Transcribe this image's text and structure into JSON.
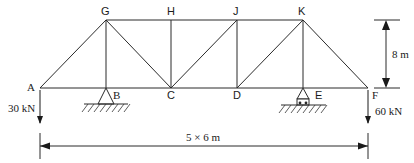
{
  "diagram": {
    "type": "truss",
    "joints": {
      "A": "A",
      "B": "B",
      "C": "C",
      "D": "D",
      "E": "E",
      "F": "F",
      "G": "G",
      "H": "H",
      "J": "J",
      "K": "K"
    },
    "members": [
      [
        "A",
        "G"
      ],
      [
        "A",
        "B"
      ],
      [
        "G",
        "B"
      ],
      [
        "G",
        "H"
      ],
      [
        "G",
        "C"
      ],
      [
        "B",
        "C"
      ],
      [
        "H",
        "C"
      ],
      [
        "H",
        "J"
      ],
      [
        "C",
        "J"
      ],
      [
        "C",
        "D"
      ],
      [
        "J",
        "D"
      ],
      [
        "J",
        "K"
      ],
      [
        "D",
        "K"
      ],
      [
        "D",
        "E"
      ],
      [
        "K",
        "E"
      ],
      [
        "K",
        "F"
      ],
      [
        "E",
        "F"
      ]
    ],
    "supports": {
      "B": "pin",
      "E": "roller"
    },
    "loads": [
      {
        "joint": "A",
        "label": "30 kN",
        "direction": "down"
      },
      {
        "joint": "F",
        "label": "60 kN",
        "direction": "down"
      }
    ],
    "dimensions": {
      "height": "8 m",
      "span": "5 × 6 m"
    }
  }
}
